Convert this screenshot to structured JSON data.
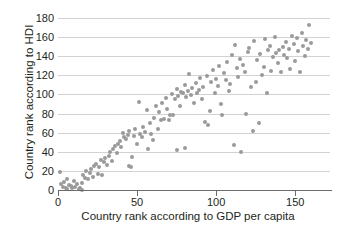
{
  "chart_data": {
    "type": "scatter",
    "title": "",
    "xlabel": "Country rank according to GDP per capita",
    "ylabel": "Country rank according to HDI",
    "xlim": [
      0,
      172
    ],
    "ylim": [
      0,
      180
    ],
    "xticks": [
      0,
      50,
      100,
      150
    ],
    "yticks": [
      0,
      20,
      40,
      60,
      80,
      100,
      120,
      140,
      160,
      180
    ],
    "xticklabels": [
      "0",
      "50",
      "100",
      "150"
    ],
    "yticklabels": [
      "0",
      "20",
      "40",
      "60",
      "80",
      "100",
      "120",
      "140",
      "160",
      "180"
    ],
    "grid": "horizontal",
    "legend": "none",
    "marker_color": "#9a9a9a",
    "marker_size": 4,
    "points": [
      [
        1,
        19
      ],
      [
        2,
        6
      ],
      [
        3,
        3
      ],
      [
        4,
        8
      ],
      [
        5,
        2
      ],
      [
        6,
        1
      ],
      [
        6,
        12
      ],
      [
        7,
        5
      ],
      [
        8,
        4
      ],
      [
        9,
        2
      ],
      [
        10,
        9
      ],
      [
        11,
        3
      ],
      [
        12,
        6
      ],
      [
        13,
        1
      ],
      [
        14,
        2
      ],
      [
        15,
        7
      ],
      [
        15,
        0
      ],
      [
        16,
        16
      ],
      [
        17,
        13
      ],
      [
        18,
        20
      ],
      [
        19,
        11
      ],
      [
        20,
        18
      ],
      [
        21,
        22
      ],
      [
        22,
        14
      ],
      [
        23,
        25
      ],
      [
        24,
        27
      ],
      [
        25,
        17
      ],
      [
        26,
        24
      ],
      [
        27,
        31
      ],
      [
        28,
        16
      ],
      [
        29,
        29
      ],
      [
        30,
        33
      ],
      [
        31,
        26
      ],
      [
        32,
        36
      ],
      [
        33,
        40
      ],
      [
        34,
        30
      ],
      [
        35,
        43
      ],
      [
        36,
        46
      ],
      [
        37,
        39
      ],
      [
        38,
        48
      ],
      [
        39,
        51
      ],
      [
        40,
        45
      ],
      [
        41,
        60
      ],
      [
        42,
        55
      ],
      [
        43,
        53
      ],
      [
        44,
        58
      ],
      [
        45,
        25
      ],
      [
        45,
        62
      ],
      [
        46,
        24
      ],
      [
        47,
        35
      ],
      [
        48,
        57
      ],
      [
        49,
        64
      ],
      [
        50,
        48
      ],
      [
        51,
        92
      ],
      [
        52,
        59
      ],
      [
        53,
        55
      ],
      [
        54,
        66
      ],
      [
        55,
        61
      ],
      [
        56,
        84
      ],
      [
        57,
        43
      ],
      [
        58,
        70
      ],
      [
        59,
        59
      ],
      [
        60,
        52
      ],
      [
        61,
        75
      ],
      [
        62,
        88
      ],
      [
        63,
        64
      ],
      [
        64,
        82
      ],
      [
        65,
        73
      ],
      [
        66,
        91
      ],
      [
        67,
        74
      ],
      [
        68,
        96
      ],
      [
        69,
        85
      ],
      [
        70,
        73
      ],
      [
        71,
        79
      ],
      [
        72,
        100
      ],
      [
        73,
        78
      ],
      [
        74,
        95
      ],
      [
        75,
        42
      ],
      [
        75,
        106
      ],
      [
        76,
        98
      ],
      [
        77,
        88
      ],
      [
        78,
        103
      ],
      [
        79,
        101
      ],
      [
        80,
        44
      ],
      [
        80,
        110
      ],
      [
        81,
        97
      ],
      [
        82,
        104
      ],
      [
        83,
        121
      ],
      [
        84,
        99
      ],
      [
        85,
        107
      ],
      [
        86,
        91
      ],
      [
        87,
        112
      ],
      [
        88,
        102
      ],
      [
        89,
        105
      ],
      [
        90,
        117
      ],
      [
        91,
        95
      ],
      [
        92,
        108
      ],
      [
        93,
        71
      ],
      [
        94,
        119
      ],
      [
        95,
        68
      ],
      [
        96,
        83
      ],
      [
        97,
        113
      ],
      [
        98,
        126
      ],
      [
        99,
        101
      ],
      [
        100,
        116
      ],
      [
        101,
        109
      ],
      [
        102,
        130
      ],
      [
        103,
        90
      ],
      [
        104,
        78
      ],
      [
        105,
        122
      ],
      [
        106,
        115
      ],
      [
        107,
        134
      ],
      [
        108,
        104
      ],
      [
        109,
        111
      ],
      [
        110,
        141
      ],
      [
        111,
        47
      ],
      [
        112,
        152
      ],
      [
        113,
        128
      ],
      [
        114,
        118
      ],
      [
        115,
        137
      ],
      [
        116,
        40
      ],
      [
        117,
        131
      ],
      [
        118,
        124
      ],
      [
        119,
        80
      ],
      [
        120,
        144
      ],
      [
        121,
        149
      ],
      [
        122,
        108
      ],
      [
        123,
        62
      ],
      [
        124,
        156
      ],
      [
        125,
        113
      ],
      [
        126,
        136
      ],
      [
        127,
        70
      ],
      [
        128,
        142
      ],
      [
        129,
        120
      ],
      [
        130,
        129
      ],
      [
        131,
        158
      ],
      [
        132,
        102
      ],
      [
        133,
        147
      ],
      [
        134,
        151
      ],
      [
        135,
        125
      ],
      [
        136,
        139
      ],
      [
        137,
        160
      ],
      [
        138,
        143
      ],
      [
        139,
        133
      ],
      [
        140,
        146
      ],
      [
        141,
        123
      ],
      [
        142,
        150
      ],
      [
        143,
        141
      ],
      [
        144,
        155
      ],
      [
        145,
        138
      ],
      [
        146,
        148
      ],
      [
        147,
        127
      ],
      [
        148,
        161
      ],
      [
        149,
        153
      ],
      [
        150,
        135
      ],
      [
        151,
        159
      ],
      [
        152,
        145
      ],
      [
        153,
        124
      ],
      [
        154,
        164
      ],
      [
        155,
        151
      ],
      [
        156,
        140
      ],
      [
        157,
        157
      ],
      [
        158,
        148
      ],
      [
        159,
        173
      ],
      [
        160,
        154
      ]
    ]
  }
}
